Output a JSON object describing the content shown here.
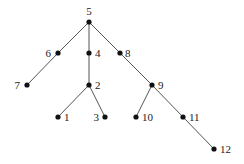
{
  "diagram": {
    "type": "tree",
    "root": "5",
    "colors": {
      "edge": "#555555",
      "node": "#111111",
      "label": "#222222"
    },
    "nodes": [
      {
        "id": "5",
        "x": 89,
        "y": 22,
        "lx": 89,
        "ly": 15,
        "anchor": "middle"
      },
      {
        "id": "6",
        "x": 58,
        "y": 53,
        "lx": 51,
        "ly": 57,
        "anchor": "end"
      },
      {
        "id": "4",
        "x": 89,
        "y": 53,
        "lx": 95,
        "ly": 57,
        "anchor": "start"
      },
      {
        "id": "8",
        "x": 120,
        "y": 53,
        "lx": 125,
        "ly": 57,
        "anchor": "start"
      },
      {
        "id": "7",
        "x": 27,
        "y": 85,
        "lx": 20,
        "ly": 89,
        "anchor": "end"
      },
      {
        "id": "2",
        "x": 89,
        "y": 85,
        "lx": 95,
        "ly": 89,
        "anchor": "start"
      },
      {
        "id": "9",
        "x": 152,
        "y": 85,
        "lx": 158,
        "ly": 89,
        "anchor": "start"
      },
      {
        "id": "1",
        "x": 58,
        "y": 117,
        "lx": 64,
        "ly": 121,
        "anchor": "start"
      },
      {
        "id": "3",
        "x": 105,
        "y": 117,
        "lx": 99,
        "ly": 121,
        "anchor": "end"
      },
      {
        "id": "10",
        "x": 136,
        "y": 117,
        "lx": 142,
        "ly": 121,
        "anchor": "start"
      },
      {
        "id": "11",
        "x": 183,
        "y": 117,
        "lx": 189,
        "ly": 121,
        "anchor": "start"
      },
      {
        "id": "12",
        "x": 214,
        "y": 149,
        "lx": 220,
        "ly": 153,
        "anchor": "start"
      }
    ],
    "edges": [
      [
        "5",
        "6"
      ],
      [
        "5",
        "4"
      ],
      [
        "5",
        "8"
      ],
      [
        "6",
        "7"
      ],
      [
        "4",
        "2"
      ],
      [
        "2",
        "1"
      ],
      [
        "2",
        "3"
      ],
      [
        "8",
        "9"
      ],
      [
        "9",
        "10"
      ],
      [
        "9",
        "11"
      ],
      [
        "11",
        "12"
      ]
    ]
  }
}
